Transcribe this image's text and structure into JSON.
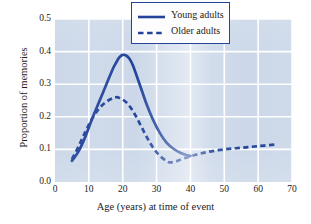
{
  "chart_data": {
    "type": "line",
    "title": "",
    "xlabel": "Age (years) at time of event",
    "ylabel": "Proportion of memories",
    "xlim": [
      0,
      70
    ],
    "ylim": [
      0.0,
      0.5
    ],
    "xticks": [
      "0",
      "10",
      "20",
      "30",
      "40",
      "50",
      "60",
      "70"
    ],
    "yticks": [
      "0.0",
      "0.1",
      "0.2",
      "0.3",
      "0.4",
      "0.5"
    ],
    "grid": true,
    "legend_position": "top-right",
    "series": [
      {
        "name": "Young adults",
        "style": "solid",
        "color": "#23449a",
        "x": [
          5,
          7,
          9,
          11,
          13,
          15,
          17,
          18,
          19,
          20,
          21,
          22,
          23,
          25,
          27,
          29,
          31,
          33,
          35,
          37,
          39,
          40
        ],
        "values": [
          0.065,
          0.095,
          0.14,
          0.195,
          0.245,
          0.295,
          0.345,
          0.365,
          0.382,
          0.39,
          0.388,
          0.378,
          0.358,
          0.3,
          0.24,
          0.19,
          0.15,
          0.12,
          0.102,
          0.09,
          0.082,
          0.08
        ]
      },
      {
        "name": "Older adults",
        "style": "dashed",
        "color": "#23449a",
        "x": [
          5,
          7,
          9,
          11,
          13,
          15,
          17,
          18,
          19,
          21,
          23,
          25,
          27,
          29,
          31,
          33,
          34,
          36,
          38,
          41,
          45,
          50,
          55,
          60,
          65
        ],
        "values": [
          0.07,
          0.11,
          0.155,
          0.195,
          0.225,
          0.245,
          0.257,
          0.26,
          0.258,
          0.245,
          0.218,
          0.18,
          0.14,
          0.105,
          0.08,
          0.064,
          0.06,
          0.064,
          0.072,
          0.082,
          0.092,
          0.1,
          0.105,
          0.11,
          0.115
        ]
      }
    ]
  },
  "legend": {
    "entries": [
      {
        "label": "Young adults",
        "style": "solid"
      },
      {
        "label": "Older adults",
        "style": "dashed"
      }
    ]
  },
  "colors": {
    "line": "#23449a",
    "panel_background": "#ccd8e9",
    "gridline": "#ffffff",
    "legend_border": "#23449a",
    "legend_background": "#fdfdfd",
    "text": "#1c1c1c"
  }
}
